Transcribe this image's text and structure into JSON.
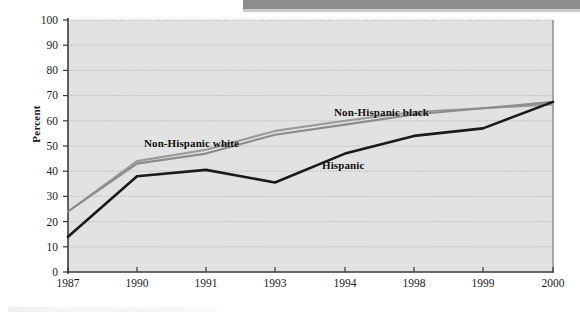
{
  "chart_data": {
    "type": "line",
    "title": "",
    "subtitle": "",
    "xlabel": "",
    "ylabel": "Percent",
    "x": [
      "1987",
      "1990",
      "1991",
      "1993",
      "1994",
      "1998",
      "1999",
      "2000"
    ],
    "xtick_labels": [
      "1987",
      "1990",
      "1991",
      "1993",
      "1994",
      "1998",
      "1999",
      "2000"
    ],
    "ytick_labels": [
      "0",
      "10",
      "20",
      "30",
      "40",
      "50",
      "60",
      "70",
      "80",
      "90",
      "100"
    ],
    "ylim": [
      0,
      100
    ],
    "ytick_step": 10,
    "grid": "horizontal-dotted",
    "legend": "inline-annotations",
    "plot_background": "#e2e2e2",
    "series": [
      {
        "name": "Hispanic",
        "color": "#1a1a1a",
        "label_position": "inline",
        "values": [
          14,
          38,
          40.5,
          35.5,
          47,
          54,
          57,
          67.5
        ]
      },
      {
        "name": "Non-Hispanic white",
        "color": "#9a9a9a",
        "label_position": "inline",
        "values": [
          24,
          44,
          48.5,
          56,
          60,
          63.5,
          65,
          66.5
        ]
      },
      {
        "name": "Non-Hispanic black",
        "color": "#8c8c8c",
        "label_position": "inline",
        "values": [
          24,
          43,
          47,
          54.5,
          58.5,
          62.5,
          65,
          67.5
        ]
      }
    ],
    "annotations": [
      {
        "text": "Non-Hispanic white",
        "x_px": 144,
        "y_px": 137
      },
      {
        "text": "Non-Hispanic black",
        "x_px": 334,
        "y_px": 106
      },
      {
        "text": "Hispanic",
        "x_px": 322,
        "y_px": 159
      }
    ]
  },
  "axes": {
    "y_title": "Percent",
    "y_ticks": [
      "100",
      "90",
      "80",
      "70",
      "60",
      "50",
      "40",
      "30",
      "20",
      "10",
      "0"
    ],
    "x_ticks": [
      "1987",
      "1990",
      "1991",
      "1993",
      "1994",
      "1998",
      "1999",
      "2000"
    ]
  },
  "labels": {
    "non_hispanic_white": "Non-Hispanic white",
    "non_hispanic_black": "Non-Hispanic black",
    "hispanic": "Hispanic"
  },
  "colors": {
    "plot_bg": "#e2e2e2",
    "axis": "#3a3a3a",
    "grid": "#b3b3b3",
    "hispanic_line": "#1a1a1a",
    "nh_white_line": "#9a9a9a",
    "nh_black_line": "#8c8c8c",
    "page_bg": "#ffffff",
    "scan_bar": "#8e8e8e"
  }
}
